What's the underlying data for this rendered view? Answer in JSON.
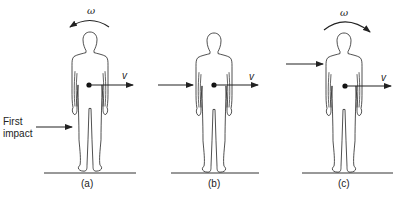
{
  "figure": {
    "panels": [
      {
        "id": "a",
        "caption": "(a)",
        "omega_label": "ω",
        "velocity_label": "v",
        "rotation": "counterclockwise",
        "impact_arrow": "below-hip",
        "side_label": "First\nimpact"
      },
      {
        "id": "b",
        "caption": "(b)",
        "velocity_label": "v",
        "impact_arrow": "at-center-of-mass"
      },
      {
        "id": "c",
        "caption": "(c)",
        "omega_label": "ω",
        "velocity_label": "v",
        "rotation": "clockwise",
        "impact_arrow": "above-center-of-mass"
      }
    ],
    "first_impact_line1": "First",
    "first_impact_line2": "impact",
    "colors": {
      "ink": "#222222",
      "background": "#ffffff"
    }
  }
}
